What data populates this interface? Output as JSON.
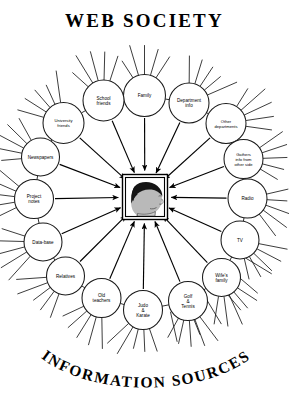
{
  "poster": {
    "title_top": "WEB SOCIETY",
    "title_bottom": "INFORMATION SOURCES",
    "background_color": "#ffffff",
    "ink_color": "#000000"
  },
  "center": {
    "name": "person-head-illustration",
    "description": "Framed portrait of a person's head in right-facing profile",
    "frame_color": "#000000",
    "hair_color": "#151515",
    "face_color": "#b9b9b9"
  },
  "diagram": {
    "type": "radial-mind-map",
    "node_count": 16,
    "arrow_direction": "inward",
    "arrow_count": 16,
    "spokes_per_node": 5,
    "nodes": [
      {
        "id": "family",
        "label": "Family",
        "label_lines": [
          "Family"
        ],
        "angle_deg": -90,
        "cx": 144.5,
        "cy": 95.5,
        "r": 21.0
      },
      {
        "id": "department-info",
        "label": "Department info",
        "label_lines": [
          "Department",
          "info"
        ],
        "angle_deg": -56.5,
        "cx": 189.0,
        "cy": 103.0,
        "r": 20.0
      },
      {
        "id": "other-departments",
        "label": "Other departments",
        "label_lines": [
          "Other",
          "departments"
        ],
        "angle_deg": -25.0,
        "cx": 226.0,
        "cy": 123.5,
        "r": 20.0
      },
      {
        "id": "gathers-info",
        "label": "Gathers info from other side",
        "label_lines": [
          "Gathers",
          "info from",
          "other side"
        ],
        "angle_deg": -2.0,
        "cx": 243.5,
        "cy": 159.0,
        "r": 19.5
      },
      {
        "id": "radio",
        "label": "Radio",
        "label_lines": [
          "Radio"
        ],
        "angle_deg": 20.0,
        "cx": 247.5,
        "cy": 198.5,
        "r": 19.5
      },
      {
        "id": "tv",
        "label": "TV",
        "label_lines": [
          "TV"
        ],
        "angle_deg": 44.0,
        "cx": 240.0,
        "cy": 240.0,
        "r": 19.0
      },
      {
        "id": "wifes-family",
        "label": "Wife's family",
        "label_lines": [
          "Wife's",
          "family"
        ],
        "angle_deg": 66.0,
        "cx": 221.5,
        "cy": 277.5,
        "r": 19.0
      },
      {
        "id": "golf-tennis",
        "label": "Golf & Tennis",
        "label_lines": [
          "Golf",
          "&",
          "Tennis"
        ],
        "angle_deg": 86.0,
        "cx": 188.0,
        "cy": 301.0,
        "r": 19.5
      },
      {
        "id": "judo-karate",
        "label": "Judo & Karate",
        "label_lines": [
          "Judo",
          "&",
          "Karate"
        ],
        "angle_deg": 104.0,
        "cx": 143.0,
        "cy": 310.0,
        "r": 19.5
      },
      {
        "id": "old-teachers",
        "label": "Old teachers",
        "label_lines": [
          "Old",
          "teachers"
        ],
        "angle_deg": 122.0,
        "cx": 101.5,
        "cy": 298.0,
        "r": 19.5
      },
      {
        "id": "relatives",
        "label": "Relatives",
        "label_lines": [
          "Relatives"
        ],
        "angle_deg": 143.0,
        "cx": 65.5,
        "cy": 276.0,
        "r": 19.0
      },
      {
        "id": "data-base",
        "label": "Data-base",
        "label_lines": [
          "Data-base"
        ],
        "angle_deg": 165.0,
        "cx": 43.0,
        "cy": 242.0,
        "r": 19.0
      },
      {
        "id": "project-notes",
        "label": "Project notes",
        "label_lines": [
          "Project",
          "notes"
        ],
        "angle_deg": 187.0,
        "cx": 34.0,
        "cy": 199.0,
        "r": 19.5
      },
      {
        "id": "newspapers",
        "label": "Newspapers",
        "label_lines": [
          "Newspapers"
        ],
        "angle_deg": 208.0,
        "cx": 40.5,
        "cy": 157.0,
        "r": 19.0
      },
      {
        "id": "university-friends",
        "label": "University friends",
        "label_lines": [
          "University",
          "friends"
        ],
        "angle_deg": 229.0,
        "cx": 63.5,
        "cy": 123.0,
        "r": 20.5
      },
      {
        "id": "school-friends",
        "label": "School friends",
        "label_lines": [
          "School",
          "friends"
        ],
        "angle_deg": 255.0,
        "cx": 103.5,
        "cy": 100.5,
        "r": 20.5
      }
    ]
  }
}
